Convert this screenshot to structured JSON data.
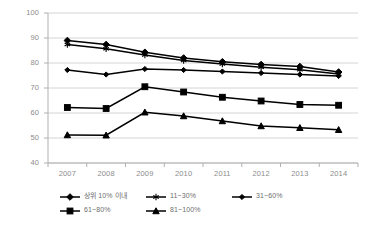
{
  "chart_data": {
    "type": "line",
    "title": "",
    "subtitle": "",
    "xlabel": "",
    "ylabel": "",
    "categories": [
      "2007",
      "2008",
      "2009",
      "2010",
      "2011",
      "2012",
      "2013",
      "2014"
    ],
    "ylim": [
      40,
      100
    ],
    "y_ticks": [
      40,
      50,
      60,
      70,
      80,
      90,
      100
    ],
    "grid": true,
    "legend_position": "bottom",
    "series": [
      {
        "name": "상위 10% 이내",
        "marker": "diamond",
        "color": "#000000",
        "values": [
          89.0,
          87.4,
          84.3,
          82.0,
          80.5,
          79.4,
          78.6,
          76.4
        ]
      },
      {
        "name": "11~30%",
        "marker": "asterisk",
        "color": "#000000",
        "values": [
          87.4,
          85.7,
          83.2,
          81.0,
          79.6,
          78.3,
          77.3,
          75.6
        ]
      },
      {
        "name": "31~60%",
        "marker": "small-diamond",
        "color": "#000000",
        "values": [
          77.2,
          75.4,
          77.6,
          77.2,
          76.6,
          76.0,
          75.4,
          74.8
        ]
      },
      {
        "name": "61~80%",
        "marker": "square",
        "color": "#000000",
        "values": [
          62.2,
          61.8,
          70.5,
          68.4,
          66.3,
          64.8,
          63.4,
          63.1
        ]
      },
      {
        "name": "81~100%",
        "marker": "triangle",
        "color": "#000000",
        "values": [
          51.2,
          51.1,
          60.3,
          58.8,
          56.8,
          54.8,
          54.1,
          53.3
        ]
      }
    ]
  },
  "axes": {
    "y_tick_labels": [
      "100",
      "90",
      "80",
      "70",
      "60",
      "50",
      "40"
    ],
    "x_tick_labels": [
      "2007",
      "2008",
      "2009",
      "2010",
      "2011",
      "2012",
      "2013",
      "2014"
    ]
  },
  "legend": {
    "rows": [
      [
        {
          "label": "상위 10% 이내",
          "marker": "diamond"
        },
        {
          "label": "11~30%",
          "marker": "asterisk"
        },
        {
          "label": "31~60%",
          "marker": "small-diamond"
        }
      ],
      [
        {
          "label": "61~80%",
          "marker": "square"
        },
        {
          "label": "81~100%",
          "marker": "triangle"
        }
      ]
    ]
  },
  "colors": {
    "series": "#000000",
    "grid": "#d4d4d4",
    "axis": "#b0b0b0",
    "tick_text": "#8c8c8c",
    "legend_text": "#6e6e6e",
    "background": "#ffffff"
  }
}
